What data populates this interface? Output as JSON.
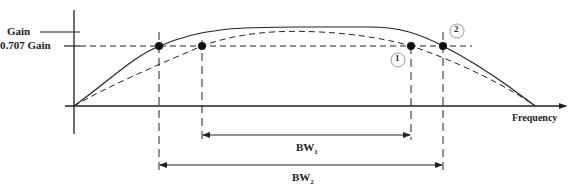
{
  "labels": {
    "gain": "Gain",
    "gain_707": "0.707 Gain",
    "x_axis": "Frequency",
    "bw1_main": "BW",
    "bw1_sub": "1",
    "bw2_main": "BW",
    "bw2_sub": "2",
    "marker1": "1",
    "marker2": "2"
  },
  "colors": {
    "line": "#222222",
    "circle": "#999999"
  },
  "curves": [
    {
      "name": "curve-1",
      "style": "dashed",
      "half_power_points": [
        "BW1 left",
        "BW1 right"
      ]
    },
    {
      "name": "curve-2",
      "style": "solid",
      "half_power_points": [
        "BW2 left",
        "BW2 right"
      ]
    }
  ]
}
